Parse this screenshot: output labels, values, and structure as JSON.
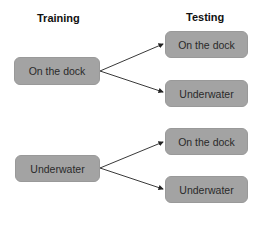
{
  "headings": {
    "training": "Training",
    "testing": "Testing"
  },
  "training_nodes": [
    {
      "label": "On the dock"
    },
    {
      "label": "Underwater"
    }
  ],
  "testing_nodes": [
    {
      "label": "On the dock"
    },
    {
      "label": "Underwater"
    },
    {
      "label": "On the dock"
    },
    {
      "label": "Underwater"
    }
  ],
  "colors": {
    "box_fill": "#a3a3a3",
    "arrow": "#222222"
  }
}
